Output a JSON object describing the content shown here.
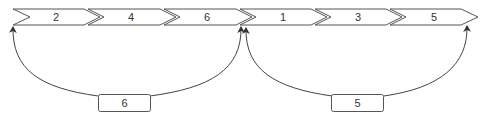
{
  "diagram": {
    "chevrons": [
      {
        "label": "2"
      },
      {
        "label": "4"
      },
      {
        "label": "6"
      },
      {
        "label": "1"
      },
      {
        "label": "3"
      },
      {
        "label": "5"
      }
    ],
    "jumps": [
      {
        "label": "6",
        "from": "chevron-6",
        "to": "chevron-2"
      },
      {
        "label": "5",
        "from": "chevron-1",
        "to": "chevron-5"
      }
    ]
  },
  "colors": {
    "stroke": "#555555",
    "fill": "#ffffff",
    "text": "#333333"
  }
}
